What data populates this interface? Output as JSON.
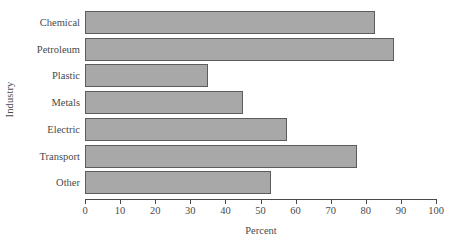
{
  "chart_data": {
    "type": "bar",
    "orientation": "horizontal",
    "title": "",
    "xlabel": "Percent",
    "ylabel": "Industry",
    "categories": [
      "Chemical",
      "Petroleum",
      "Plastic",
      "Metals",
      "Electric",
      "Transport",
      "Other"
    ],
    "values": [
      82.5,
      88,
      35,
      45,
      57.5,
      77.5,
      53
    ],
    "xlim": [
      0,
      100
    ],
    "xticks": [
      0,
      10,
      20,
      30,
      40,
      50,
      60,
      70,
      80,
      90,
      100
    ],
    "xtick_labels": [
      "0",
      "10",
      "20",
      "30",
      "40",
      "50",
      "60",
      "70",
      "80",
      "90",
      "100"
    ],
    "grid": false,
    "legend": null,
    "bar_color": "#a8a8a8",
    "bar_border_color": "#5c5c5c",
    "axis_color": "#4a4a4a"
  }
}
